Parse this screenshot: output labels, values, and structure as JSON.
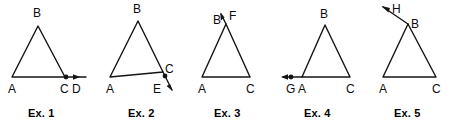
{
  "sheet": {
    "background_color": "#ffffff",
    "stroke_color": "#141414",
    "label_color": "#0d0d0d"
  },
  "figures": [
    {
      "caption": "Ex. 1",
      "vertices": {
        "A": "A",
        "B": "B",
        "C": "C"
      },
      "ray_endpoint": "D",
      "ray_description": "ray from C along base AC extended to the right, arrowhead at D, dot marked at C",
      "labels": {
        "apex": "B",
        "left_base": "A",
        "right_base": "C",
        "ray": "D"
      }
    },
    {
      "caption": "Ex. 2",
      "vertices": {
        "A": "A",
        "B": "B",
        "C": "C"
      },
      "ray_endpoint": "E",
      "ray_description": "side BC extended beyond C downward to the right, arrowhead past E",
      "labels": {
        "apex": "B",
        "left_base": "A",
        "right_base": "C",
        "ray": "E"
      }
    },
    {
      "caption": "Ex. 3",
      "vertices": {
        "A": "A",
        "B": "B",
        "C": "C"
      },
      "ray_endpoint": "F",
      "ray_description": "side AB extended beyond B upward to the right, arrowhead at F",
      "labels": {
        "apex": "B",
        "left_base": "A",
        "right_base": "C",
        "ray": "F"
      }
    },
    {
      "caption": "Ex. 4",
      "vertices": {
        "A": "A",
        "B": "B",
        "C": "C"
      },
      "ray_endpoint": "G",
      "ray_description": "base CA extended beyond A to the left, arrowhead past G, dot marked at G",
      "labels": {
        "apex": "B",
        "left_base": "A",
        "right_base": "C",
        "ray": "G"
      }
    },
    {
      "caption": "Ex. 5",
      "vertices": {
        "A": "A",
        "B": "B",
        "C": "C"
      },
      "ray_endpoint": "H",
      "ray_description": "side CB extended beyond B upward to the left, arrowhead at H",
      "labels": {
        "apex": "B",
        "left_base": "A",
        "right_base": "C",
        "ray": "H"
      }
    }
  ]
}
